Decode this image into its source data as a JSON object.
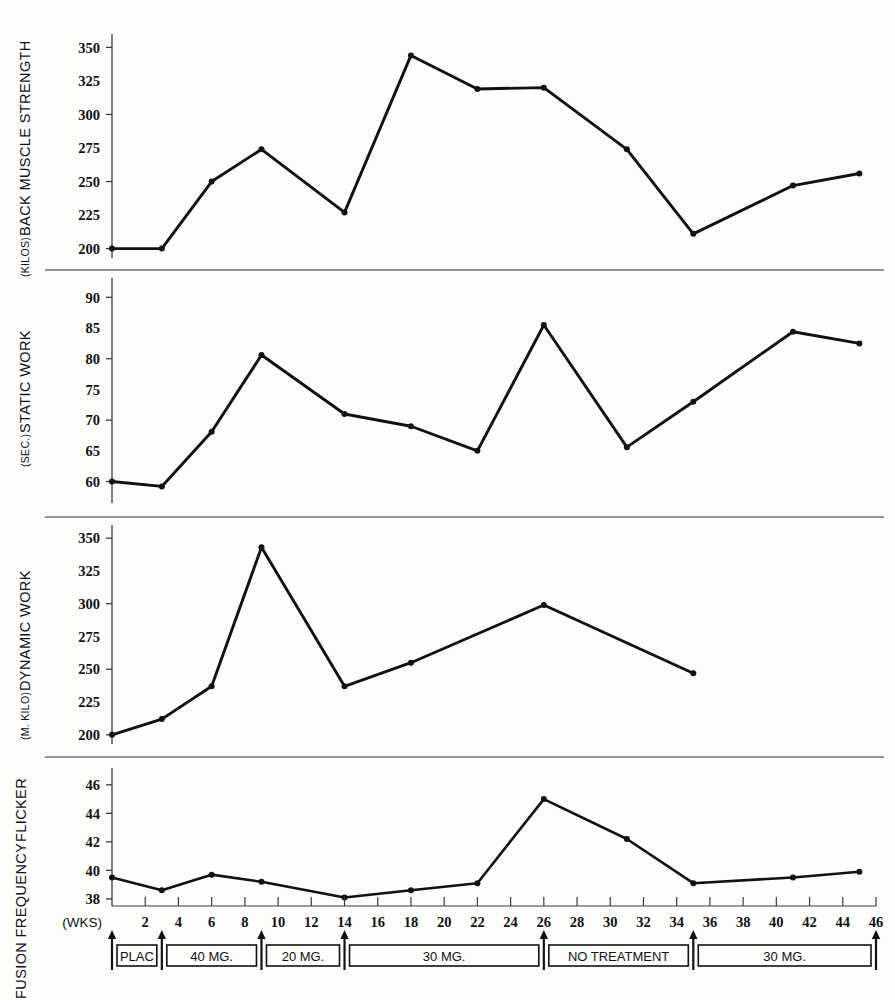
{
  "figure": {
    "background": "#fdfdfc",
    "ink": "#111111",
    "axis_color": "#3a3a3a"
  },
  "axis": {
    "x_unit_label": "(WKS)",
    "dosage_row_label": "(DOSAGE)",
    "x_ticks": [
      2,
      4,
      6,
      8,
      10,
      12,
      14,
      16,
      18,
      20,
      22,
      24,
      26,
      28,
      30,
      32,
      34,
      36,
      38,
      40,
      42,
      44,
      46
    ],
    "x_min": 0,
    "x_max": 46
  },
  "dosage_bar": {
    "segments": [
      {
        "label": "PLAC",
        "start": 0,
        "end": 3
      },
      {
        "label": "40 MG.",
        "start": 3,
        "end": 9
      },
      {
        "label": "20 MG.",
        "start": 9,
        "end": 14
      },
      {
        "label": "30 MG.",
        "start": 14,
        "end": 26
      },
      {
        "label": "NO TREATMENT",
        "start": 26,
        "end": 35
      },
      {
        "label": "30 MG.",
        "start": 35,
        "end": 46
      }
    ],
    "arrow_positions": [
      0,
      3,
      9,
      14,
      26,
      35,
      46
    ]
  },
  "chart_data": [
    {
      "type": "line",
      "panel_index": 0,
      "title": "",
      "ylabel": "BACK MUSCLE STRENGTH",
      "ylabel_units": "(KILOS)",
      "xlabel": "(WKS)",
      "ylim": [
        193,
        357
      ],
      "yticks": [
        200,
        225,
        250,
        275,
        300,
        325,
        350
      ],
      "ytick_labels": [
        "200",
        "225",
        "250",
        "275",
        "300",
        "325",
        "350"
      ],
      "major_ticks": [
        200,
        250,
        300,
        350
      ],
      "x": [
        0,
        3,
        6,
        9,
        14,
        18,
        22,
        26,
        31,
        35,
        41,
        45
      ],
      "values": [
        200,
        200,
        250,
        274,
        227,
        344,
        319,
        320,
        274,
        211,
        247,
        256
      ],
      "grid": false,
      "legend": "none"
    },
    {
      "type": "line",
      "panel_index": 1,
      "title": "",
      "ylabel": "STATIC WORK",
      "ylabel_units": "(SEC.)",
      "xlabel": "(WKS)",
      "ylim": [
        56.5,
        92.5
      ],
      "yticks": [
        60,
        65,
        70,
        75,
        80,
        85,
        90
      ],
      "ytick_labels": [
        "60",
        "65",
        "70",
        "75",
        "80",
        "85",
        "90"
      ],
      "major_ticks": [
        60,
        70,
        80,
        90
      ],
      "x": [
        0,
        3,
        6,
        9,
        14,
        18,
        22,
        26,
        31,
        35,
        41,
        45
      ],
      "values": [
        60.0,
        59.2,
        68.1,
        80.6,
        71.0,
        69.0,
        65.0,
        85.5,
        65.6,
        73.0,
        84.4,
        82.5
      ],
      "grid": false,
      "legend": "none"
    },
    {
      "type": "line",
      "panel_index": 2,
      "title": "",
      "ylabel": "DYNAMIC WORK",
      "ylabel_units": "(M. KILO)",
      "xlabel": "(WKS)",
      "ylim": [
        193,
        357
      ],
      "yticks": [
        200,
        225,
        250,
        275,
        300,
        325,
        350
      ],
      "ytick_labels": [
        "200",
        "225",
        "250",
        "275",
        "300",
        "325",
        "350"
      ],
      "major_ticks": [
        200,
        250,
        300,
        350
      ],
      "x": [
        0,
        3,
        6,
        9,
        14,
        18,
        26,
        35
      ],
      "values": [
        200,
        212,
        237,
        343,
        237,
        255,
        299,
        247
      ],
      "grid": false,
      "legend": "none"
    },
    {
      "type": "line",
      "panel_index": 3,
      "title": "",
      "ylabel_line1": "FLICKER",
      "ylabel_line2": "FUSION FREQUENCY",
      "ylabel_units": "(FLASHES PER SEC)",
      "xlabel": "(WKS)",
      "ylim": [
        37.5,
        46.9
      ],
      "yticks": [
        38,
        40,
        42,
        44,
        46
      ],
      "ytick_labels": [
        "38",
        "40",
        "42",
        "44",
        "46"
      ],
      "major_ticks": [
        38,
        40,
        42,
        44,
        46
      ],
      "x": [
        0,
        3,
        6,
        9,
        14,
        18,
        22,
        26,
        31,
        35,
        41,
        45
      ],
      "values": [
        39.5,
        38.6,
        39.7,
        39.2,
        38.1,
        38.6,
        39.1,
        45.0,
        42.2,
        39.1,
        39.5,
        39.9
      ],
      "grid": false,
      "legend": "none"
    }
  ]
}
